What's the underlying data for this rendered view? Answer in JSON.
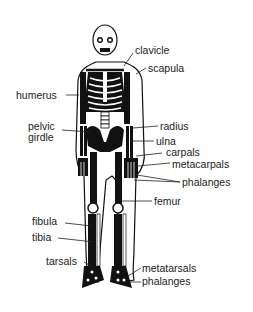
{
  "diagram": {
    "labels": {
      "clavicle": "clavicle",
      "scapula": "scapula",
      "humerus": "humerus",
      "pelvic_girdle_1": "pelvic",
      "pelvic_girdle_2": "girdle",
      "radius": "radius",
      "ulna": "ulna",
      "carpals": "carpals",
      "metacarpals": "metacarpals",
      "phalanges_hand": "phalanges",
      "femur": "femur",
      "fibula": "fibula",
      "tibia": "tibia",
      "tarsals": "tarsals",
      "metatarsals": "metatarsals",
      "phalanges_foot": "phalanges"
    }
  }
}
